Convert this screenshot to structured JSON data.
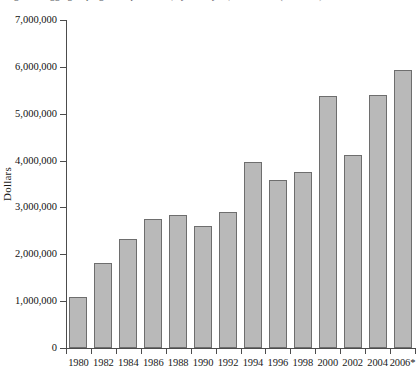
{
  "figure": {
    "caption_fragment": "Figure 1.  Aggregate program expenditures, by fiscal year, 1980–2006 (in dollars)"
  },
  "chart_data": {
    "type": "bar",
    "title": "",
    "xlabel": "",
    "ylabel": "Dollars",
    "ylim": [
      0,
      7000000
    ],
    "ytick_step": 1000000,
    "grid": false,
    "legend": "none",
    "footnote_marker": "*",
    "categories": [
      "1980",
      "1982",
      "1984",
      "1986",
      "1988",
      "1990",
      "1992",
      "1994",
      "1996",
      "1998",
      "2000",
      "2002",
      "2004",
      "2006*"
    ],
    "values": [
      1090000,
      1810000,
      2330000,
      2750000,
      2840000,
      2600000,
      2900000,
      3980000,
      3580000,
      3750000,
      5370000,
      4120000,
      5410000,
      5930000
    ],
    "ytick_labels": [
      "0",
      "1,000,000",
      "2,000,000",
      "3,000,000",
      "4,000,000",
      "5,000,000",
      "6,000,000",
      "7,000,000"
    ],
    "ytick_values": [
      0,
      1000000,
      2000000,
      3000000,
      4000000,
      5000000,
      6000000,
      7000000
    ],
    "colors": {
      "bar_fill": "#b9b9b9",
      "bar_border": "#6e6e6e",
      "axis": "#4c4c4c",
      "text": "#111111",
      "background": "#ffffff"
    }
  }
}
